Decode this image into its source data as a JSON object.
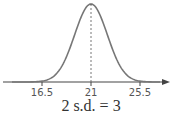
{
  "chart_data": {
    "type": "line",
    "title": "",
    "xlabel": "",
    "ylabel": "",
    "distribution": "normal",
    "mean": 21,
    "sd": 1.5,
    "xlim": [
      13.5,
      28.5
    ],
    "x_ticks": [
      16.5,
      21,
      25.5
    ],
    "x_tick_labels": [
      "16.5",
      "21",
      "25.5"
    ],
    "mean_marker": "dashed-vertical-line",
    "annotation": "2 s.d. = 3",
    "grid": false,
    "colors": {
      "curve": "#777777",
      "axis": "#444444",
      "mean_line": "#666666"
    }
  }
}
